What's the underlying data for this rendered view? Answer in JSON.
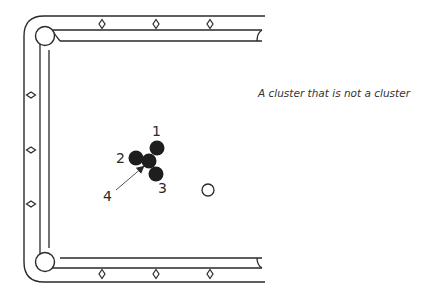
{
  "caption": "A cluster that is not a cluster",
  "colors": {
    "line": "#2a2a2a",
    "object_ball": "#1e1e1e",
    "cue_ball_fill": "#ffffff",
    "background": "#ffffff"
  },
  "table": {
    "visible_section": "left half of pool table",
    "pockets": [
      {
        "id": "top-left-corner",
        "cx": 45,
        "cy": 35,
        "r": 10
      },
      {
        "id": "bottom-left-corner",
        "cx": 45,
        "cy": 262,
        "r": 10
      },
      {
        "id": "top-side-partial",
        "x": 260,
        "y": 33
      },
      {
        "id": "bottom-side-partial",
        "x": 260,
        "y": 265
      }
    ],
    "diamonds": {
      "top": [
        [
          102,
          24
        ],
        [
          156,
          24
        ],
        [
          210,
          24
        ]
      ],
      "bottom": [
        [
          102,
          274
        ],
        [
          156,
          274
        ],
        [
          210,
          274
        ]
      ],
      "left": [
        [
          31,
          95
        ],
        [
          31,
          150
        ],
        [
          31,
          204
        ]
      ]
    }
  },
  "balls": [
    {
      "label": "1",
      "cx": 157,
      "cy": 148,
      "r": 7.5,
      "type": "object"
    },
    {
      "label": "2",
      "cx": 136,
      "cy": 158,
      "r": 7.5,
      "type": "object"
    },
    {
      "label": "3",
      "cx": 156,
      "cy": 174,
      "r": 7.5,
      "type": "object"
    },
    {
      "label": "4",
      "cx": 149,
      "cy": 161,
      "r": 7.5,
      "type": "object"
    },
    {
      "label": "cue",
      "cx": 208,
      "cy": 190,
      "r": 6,
      "type": "cue"
    }
  ],
  "labels": [
    {
      "text": "1",
      "x": 152,
      "y": 136
    },
    {
      "text": "2",
      "x": 116,
      "y": 163
    },
    {
      "text": "3",
      "x": 158,
      "y": 193
    },
    {
      "text": "4",
      "x": 103,
      "y": 201
    }
  ],
  "arrow": {
    "from": [
      116,
      190
    ],
    "to": [
      143,
      167
    ],
    "points_to": "4"
  }
}
